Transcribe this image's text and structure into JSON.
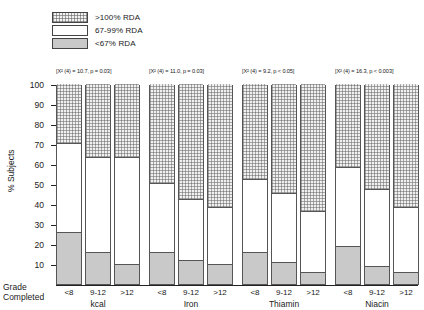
{
  "legend": {
    "items": [
      {
        "label": ">100% RDA",
        "pattern": "hatch",
        "icon": "swatch-hatched"
      },
      {
        "label": "67-99% RDA",
        "pattern": "white",
        "icon": "swatch-white"
      },
      {
        "label": "<67% RDA",
        "pattern": "solid",
        "icon": "swatch-solid-gray"
      }
    ]
  },
  "axes": {
    "ylabel": "% Subjects",
    "grade_label_line1": "Grade",
    "grade_label_line2": "Completed",
    "yticks": [
      "100",
      "90",
      "80",
      "70",
      "60",
      "50",
      "40",
      "30",
      "20",
      "10"
    ]
  },
  "chart_data": {
    "type": "bar",
    "subtype": "stacked-percentage",
    "title": "",
    "xlabel": "Grade Completed",
    "ylabel": "% Subjects",
    "ylim": [
      0,
      100
    ],
    "yticks": [
      10,
      20,
      30,
      40,
      50,
      60,
      70,
      80,
      90,
      100
    ],
    "grid": false,
    "legend_position": "top-left",
    "categories": [
      "<8",
      "9-12",
      ">12"
    ],
    "series": [
      {
        "name": "<67% RDA",
        "pattern": "solid-gray"
      },
      {
        "name": "67-99% RDA",
        "pattern": "white"
      },
      {
        "name": ">100% RDA",
        "pattern": "hatched"
      }
    ],
    "groups": [
      {
        "name": "kcal",
        "stat": "[X² (4) = 10.7, p = 0.03]",
        "bars": [
          {
            "category": "<8",
            "low": 26,
            "mid": 44,
            "high": 30
          },
          {
            "category": "9-12",
            "low": 16,
            "mid": 47,
            "high": 37
          },
          {
            "category": ">12",
            "low": 10,
            "mid": 53,
            "high": 37
          }
        ]
      },
      {
        "name": "Iron",
        "stat": "[X² (4) = 11.0, p = 0.03]",
        "bars": [
          {
            "category": "<8",
            "low": 16,
            "mid": 34,
            "high": 50
          },
          {
            "category": "9-12",
            "low": 12,
            "mid": 30,
            "high": 58
          },
          {
            "category": ">12",
            "low": 10,
            "mid": 28,
            "high": 62
          }
        ]
      },
      {
        "name": "Thiamin",
        "stat": "[X² (4) = 9.2, p < 0.05]",
        "bars": [
          {
            "category": "<8",
            "low": 16,
            "mid": 36,
            "high": 48
          },
          {
            "category": "9-12",
            "low": 11,
            "mid": 34,
            "high": 55
          },
          {
            "category": ">12",
            "low": 6,
            "mid": 30,
            "high": 64
          }
        ]
      },
      {
        "name": "Niacin",
        "stat": "[X² (4) = 16.3, p < 0.003]",
        "bars": [
          {
            "category": "<8",
            "low": 19,
            "mid": 39,
            "high": 42
          },
          {
            "category": "9-12",
            "low": 9,
            "mid": 38,
            "high": 53
          },
          {
            "category": ">12",
            "low": 6,
            "mid": 32,
            "high": 62
          }
        ]
      }
    ]
  },
  "colors": {
    "gray_fill": "#c9c9c9",
    "hatch_line": "#5f5f5f",
    "axis": "#222222",
    "background": "#ffffff"
  }
}
